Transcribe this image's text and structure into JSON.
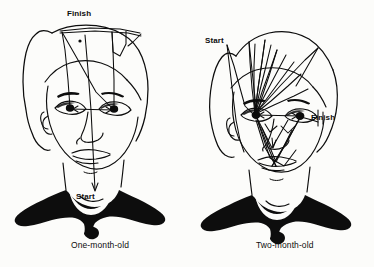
{
  "figure": {
    "background_color": "#fcfcfa",
    "ink_color": "#0d0d0d",
    "type": "line-drawing-diagram"
  },
  "panels": [
    {
      "id": "left",
      "caption": "One-month-old",
      "annotations": [
        {
          "id": "finish-left",
          "label": "Finish",
          "position": "top-of-head"
        },
        {
          "id": "start-left",
          "label": "Start",
          "position": "neck"
        }
      ]
    },
    {
      "id": "right",
      "caption": "Two-month-old",
      "annotations": [
        {
          "id": "start-right",
          "label": "Start",
          "position": "left-temple"
        },
        {
          "id": "finish-right",
          "label": "Finish",
          "position": "right-eye"
        }
      ]
    }
  ],
  "labels": {
    "finish_left": "Finish",
    "start_left": "Start",
    "start_right": "Start",
    "finish_right": "Finish",
    "caption_left": "One-month-old",
    "caption_right": "Two-month-old"
  }
}
